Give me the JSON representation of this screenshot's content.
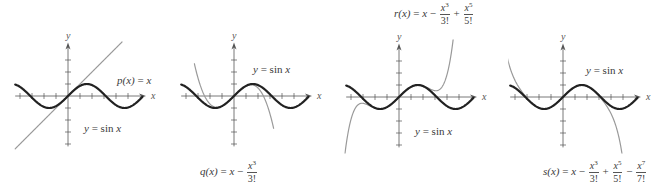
{
  "chart_data": [
    {
      "type": "line",
      "panel": 1,
      "origin_px": [
        68,
        96
      ],
      "unit_px": 12,
      "x_range": [
        -4.4,
        6.5
      ],
      "y_range": [
        -4.2,
        4.3
      ],
      "axis_labels": {
        "x": "x",
        "y": "y"
      },
      "series": [
        {
          "name": "y = sin x",
          "fn": "sin",
          "color": "#222222",
          "width": 2.2,
          "x_range": [
            -4.4,
            6.2
          ]
        },
        {
          "name": "p(x) = x",
          "fn": "p1",
          "color": "#9a9a9a",
          "width": 1.2,
          "x_range": [
            -4.4,
            4.5
          ]
        }
      ],
      "labels": [
        {
          "id": "p",
          "text": "p(x) = x",
          "left": 117,
          "top": 75
        },
        {
          "id": "sin",
          "text": "y = sin x",
          "left": 84,
          "top": 122
        }
      ]
    },
    {
      "type": "line",
      "panel": 2,
      "origin_px": [
        234,
        96
      ],
      "unit_px": 12,
      "x_range": [
        -4.4,
        6.5
      ],
      "y_range": [
        -4.2,
        4.3
      ],
      "axis_labels": {
        "x": "x",
        "y": "y"
      },
      "series": [
        {
          "name": "y = sin x",
          "fn": "sin",
          "color": "#222222",
          "width": 2.2,
          "x_range": [
            -4.4,
            6.2
          ]
        },
        {
          "name": "q(x) = x - x^3/3!",
          "fn": "p3",
          "color": "#9a9a9a",
          "width": 1.2,
          "x_range": [
            -3.3,
            3.3
          ]
        }
      ],
      "labels": [
        {
          "id": "sin",
          "text": "y = sin x",
          "left": 254,
          "top": 63
        },
        {
          "id": "q",
          "text": "q(x) = x - x^3/3!",
          "left": 200,
          "top": 163
        }
      ]
    },
    {
      "type": "line",
      "panel": 3,
      "origin_px": [
        399,
        97
      ],
      "unit_px": 12,
      "x_range": [
        -4.4,
        6.5
      ],
      "y_range": [
        -4.2,
        4.3
      ],
      "axis_labels": {
        "x": "x",
        "y": "y"
      },
      "series": [
        {
          "name": "y = sin x",
          "fn": "sin",
          "color": "#222222",
          "width": 2.2,
          "x_range": [
            -4.4,
            6.2
          ]
        },
        {
          "name": "r(x) = x - x^3/3! + x^5/5!",
          "fn": "p5",
          "color": "#9a9a9a",
          "width": 1.2,
          "x_range": [
            -4.6,
            4.6
          ]
        }
      ],
      "labels": [
        {
          "id": "sin",
          "text": "y = sin x",
          "left": 415,
          "top": 125
        },
        {
          "id": "r",
          "text": "r(x) = x - x^3/3! + x^5/5!",
          "left": 394,
          "top": 3
        }
      ]
    },
    {
      "type": "line",
      "panel": 4,
      "origin_px": [
        563,
        97
      ],
      "unit_px": 12,
      "x_range": [
        -4.4,
        6.5
      ],
      "y_range": [
        -4.2,
        4.3
      ],
      "axis_labels": {
        "x": "x",
        "y": "y"
      },
      "series": [
        {
          "name": "y = sin x",
          "fn": "sin",
          "color": "#222222",
          "width": 2.2,
          "x_range": [
            -4.4,
            6.2
          ]
        },
        {
          "name": "s(x) = x - x^3/3! + x^5/5! - x^7/7!",
          "fn": "p7",
          "color": "#9a9a9a",
          "width": 1.2,
          "x_range": [
            -4.7,
            5.0
          ]
        }
      ],
      "labels": [
        {
          "id": "sin",
          "text": "y = sin x",
          "left": 586,
          "top": 65
        },
        {
          "id": "s",
          "text": "s(x) = x - x^3/3! + x^5/5! - x^7/7!",
          "left": 544,
          "top": 162
        }
      ]
    }
  ],
  "text": {
    "p_label": {
      "lhs": "p(x)",
      "eq": "=",
      "rhs": "x"
    },
    "q_label": {
      "lhs": "q(x)",
      "eq": "=",
      "x": "x",
      "minus": "−",
      "num": "x",
      "exp": "3",
      "den": "3!"
    },
    "r_label": {
      "lhs": "r(x)",
      "eq": "=",
      "x": "x",
      "minus": "−",
      "num3": "x",
      "exp3": "3",
      "den3": "3!",
      "plus": "+",
      "num5": "x",
      "exp5": "5",
      "den5": "5!"
    },
    "s_label": {
      "lhs": "s(x)",
      "eq": "=",
      "x": "x",
      "minus": "−",
      "num3": "x",
      "exp3": "3",
      "den3": "3!",
      "plus": "+",
      "num5": "x",
      "exp5": "5",
      "den5": "5!",
      "minus2": "−",
      "num7": "x",
      "exp7": "7",
      "den7": "7!"
    },
    "sin_label": {
      "y": "y",
      "eq": "=",
      "fn": "sin",
      "arg": "x"
    },
    "axis_x": "x",
    "axis_y": "y"
  },
  "colors": {
    "sine": "#222222",
    "poly": "#9a9a9a",
    "axis": "#555555"
  }
}
